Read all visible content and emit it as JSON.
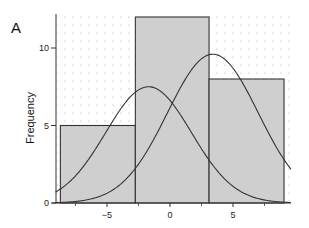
{
  "panel_label": "A",
  "chart_data": {
    "type": "bar",
    "title": "",
    "xlabel": "",
    "ylabel": "Frequency",
    "bins": [
      {
        "x0": -8.7,
        "x1": -2.75,
        "count": 5
      },
      {
        "x0": -2.75,
        "x1": 3.1,
        "count": 12
      },
      {
        "x0": 3.1,
        "x1": 9.05,
        "count": 8
      }
    ],
    "categories": [
      "[-8.7,-2.75)",
      "[-2.75,3.1)",
      "[3.1,9.05]"
    ],
    "values": [
      5,
      12,
      8
    ],
    "overlay_curves": [
      {
        "type": "normal_density_scaled",
        "peak_x": -1.7,
        "peak_y": 7.5,
        "sd": 3.4
      },
      {
        "type": "normal_density_scaled",
        "peak_x": 3.4,
        "peak_y": 9.6,
        "sd": 3.6
      }
    ],
    "xlim": [
      -9.2,
      9.6
    ],
    "ylim": [
      0,
      12.2
    ],
    "x_ticks": [
      -5,
      0,
      5
    ],
    "x_minor_ticks": [
      -7.5,
      -2.5,
      2.5,
      7.5
    ],
    "y_ticks": [
      0,
      5,
      10
    ],
    "grid": "dotted background grid",
    "legend": "none",
    "colors": {
      "bar_fill": "#cfcfcf",
      "bar_edge": "#333333",
      "curve": "#333333",
      "axis": "#333333"
    }
  },
  "axes": {
    "ylabel": "Frequency",
    "x_tick_labels": [
      "−5",
      "0",
      "5"
    ],
    "y_tick_labels": [
      "0",
      "5",
      "10"
    ]
  }
}
